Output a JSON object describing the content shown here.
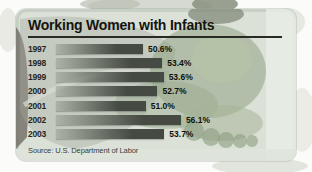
{
  "chart_data": {
    "type": "bar",
    "orientation": "horizontal",
    "title": "Working Women with Infants",
    "categories": [
      "1997",
      "1998",
      "1999",
      "2000",
      "2001",
      "2002",
      "2003"
    ],
    "values": [
      50.6,
      53.4,
      53.6,
      52.7,
      51.0,
      56.1,
      53.7
    ],
    "value_labels": [
      "50.6%",
      "53.4%",
      "53.6%",
      "52.7%",
      "51.0%",
      "56.1%",
      "53.7%"
    ],
    "source": "Source: U.S. Department of Labor",
    "xlim": [
      38,
      60
    ],
    "grid": false,
    "legend": false,
    "xlabel": "",
    "ylabel": ""
  },
  "colors": {
    "bar_dark": "#454a42",
    "bar_light": "#868e80",
    "card_bg": "#c7d0c5",
    "card_inner_bg": "#dbe1d7",
    "title_text": "#14140f",
    "underline": "#2a2a24",
    "photo_duotone_green": "#90a284"
  }
}
